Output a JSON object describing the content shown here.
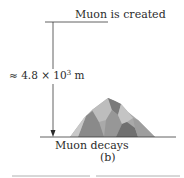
{
  "figure": {
    "top_label": "Muon is created",
    "distance_label": {
      "approx_symbol": "≈",
      "mantissa": "4.8",
      "times": "×",
      "base": "10",
      "exponent": "3",
      "unit": "m"
    },
    "bottom_label": "Muon decays",
    "part_label": "(b)",
    "mountain_icon": "mountain-icon",
    "colors": {
      "line": "#3a3a3a",
      "mountain_light": "#b9b9b9",
      "mountain_mid": "#8f8f8f",
      "mountain_dark": "#6c6c6c",
      "rule": "#b0b0b0"
    }
  }
}
